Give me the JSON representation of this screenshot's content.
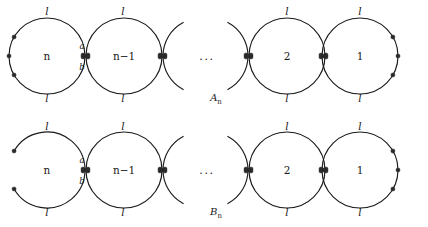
{
  "figure": {
    "type": "diagram",
    "ellipsis": "...",
    "rows": [
      {
        "id": "A",
        "row_label": "A",
        "row_label_sub": "n",
        "left_end_closed": true,
        "circles": [
          {
            "center_label": "n",
            "top_label": "l",
            "bottom_label": "l"
          },
          {
            "center_label": "n−1",
            "top_label": "l",
            "bottom_label": "l"
          },
          {
            "center_label": "2",
            "top_label": "l",
            "bottom_label": "l"
          },
          {
            "center_label": "1",
            "top_label": "l",
            "bottom_label": "l"
          }
        ],
        "node_labels": {
          "upper": "a",
          "lower": "b"
        }
      },
      {
        "id": "B",
        "row_label": "B",
        "row_label_sub": "n",
        "left_end_closed": false,
        "circles": [
          {
            "center_label": "n",
            "top_label": "l",
            "bottom_label": "l"
          },
          {
            "center_label": "n−1",
            "top_label": "l",
            "bottom_label": "l"
          },
          {
            "center_label": "2",
            "top_label": "l",
            "bottom_label": "l"
          },
          {
            "center_label": "1",
            "top_label": "l",
            "bottom_label": "l"
          }
        ],
        "node_labels": {
          "upper": "a",
          "lower": "b"
        }
      }
    ],
    "colors": {
      "stroke": "#1a1a1a",
      "node_fill": "#2a2a2a",
      "background": "#ffffff",
      "text": "#1a1a1a"
    }
  }
}
